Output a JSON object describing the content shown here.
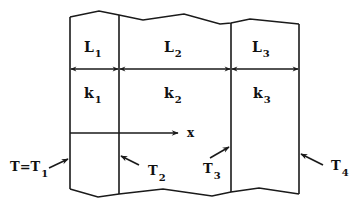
{
  "diagram": {
    "type": "composite-wall-heat-conduction",
    "layers": [
      {
        "id": "layer-1",
        "length_label": "L",
        "length_sub": "1",
        "conductivity_label": "k",
        "conductivity_sub": "1"
      },
      {
        "id": "layer-2",
        "length_label": "L",
        "length_sub": "2",
        "conductivity_label": "k",
        "conductivity_sub": "2"
      },
      {
        "id": "layer-3",
        "length_label": "L",
        "length_sub": "3",
        "conductivity_label": "k",
        "conductivity_sub": "3"
      }
    ],
    "interfaces": [
      {
        "id": "T1",
        "prefix": "T=T",
        "sub": "1"
      },
      {
        "id": "T2",
        "prefix": "T",
        "sub": "2"
      },
      {
        "id": "T3",
        "prefix": "T",
        "sub": "3"
      },
      {
        "id": "T4",
        "prefix": "T",
        "sub": "4"
      }
    ],
    "axis": {
      "label": "x"
    },
    "colors": {
      "line": "#1a1a1a",
      "text": "#111111",
      "background": "#ffffff"
    }
  }
}
